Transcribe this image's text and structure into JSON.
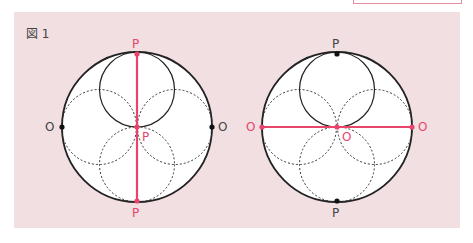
{
  "figure": {
    "title": "図 1",
    "colors": {
      "background": "#f1dfe2",
      "accent": "#e8456a",
      "ink": "#222222"
    },
    "left_diagram": {
      "labels": {
        "top": "P",
        "center": "P",
        "bottom": "P",
        "left": "O",
        "right": "O"
      },
      "highlighted_axis": "vertical"
    },
    "right_diagram": {
      "labels": {
        "top": "P",
        "center": "O",
        "bottom": "P",
        "left": "O",
        "right": "O"
      },
      "highlighted_axis": "horizontal"
    }
  }
}
